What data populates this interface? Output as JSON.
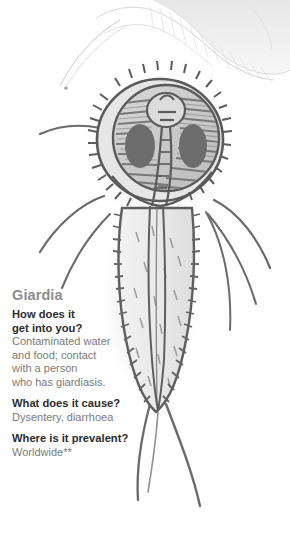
{
  "panel": {
    "background_color": "#ffffff",
    "organism_name": "Giardia"
  },
  "info": {
    "title": "Giardia",
    "entries": [
      {
        "question": "How does it",
        "question_line2": "get into you?",
        "answer_lines": [
          "Contaminated water",
          "and food; contact",
          "with a person",
          "who has giardiasis."
        ]
      },
      {
        "question": "What does it cause?",
        "answer_lines": [
          "Dysentery, diarrhoea"
        ]
      },
      {
        "question": "Where is it prevalent?",
        "answer_lines": [
          "Worldwide**"
        ]
      }
    ]
  },
  "illustration": {
    "main_label": "giardia-parasite-illustration",
    "top_fragment_label": "partial-organism-illustration",
    "outline_color": "#5a5a5a",
    "body_fill": "#efefef",
    "nucleus_color": "#6a6a6a",
    "shadow_color": "#d8d8d8",
    "top_fragment_color": "#ededed"
  },
  "colors": {
    "title_gray": "#8c8c8c",
    "question_dark": "#2b2b2b",
    "answer_gray": "#7b7b7b"
  }
}
